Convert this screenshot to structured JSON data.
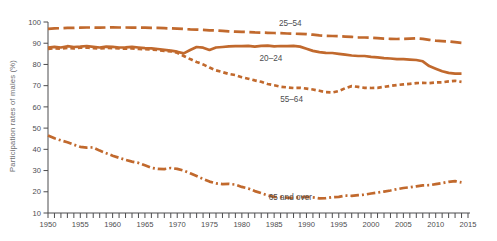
{
  "figure": {
    "background": "#ffffff"
  },
  "chart_data": {
    "type": "line",
    "title": "",
    "xlabel": "",
    "ylabel": "Participation rates of males (%)",
    "ylim": [
      10,
      100
    ],
    "xlim": [
      1950,
      2015
    ],
    "yticks": [
      100,
      90,
      80,
      70,
      60,
      50,
      40,
      30,
      20,
      10
    ],
    "xtick_labels": [
      1950,
      1955,
      1960,
      1965,
      1970,
      1975,
      1980,
      1985,
      1990,
      1995,
      2000,
      2005,
      2010,
      2015
    ],
    "xtick_minor_step": 1,
    "grid": false,
    "legend_position": "inline-labels",
    "line_color": "#c1692d",
    "axis_color": "#4d4d4f",
    "text_color": "#4d4d4f",
    "ylabel_color": "#6d6e71",
    "years": [
      1950,
      1951,
      1952,
      1953,
      1954,
      1955,
      1956,
      1957,
      1958,
      1959,
      1960,
      1961,
      1962,
      1963,
      1964,
      1965,
      1966,
      1967,
      1968,
      1969,
      1970,
      1971,
      1972,
      1973,
      1974,
      1975,
      1976,
      1977,
      1978,
      1979,
      1980,
      1981,
      1982,
      1983,
      1984,
      1985,
      1986,
      1987,
      1988,
      1989,
      1990,
      1991,
      1992,
      1993,
      1994,
      1995,
      1996,
      1997,
      1998,
      1999,
      2000,
      2001,
      2002,
      2003,
      2004,
      2005,
      2006,
      2007,
      2008,
      2009,
      2010,
      2011,
      2012,
      2013,
      2014
    ],
    "series": [
      {
        "name": "25-54",
        "label": "25–54",
        "dash": "long-dash",
        "label_pos": {
          "year": 1987.5,
          "value": 98.2
        },
        "values": [
          96.8,
          97,
          97.1,
          97.2,
          97.2,
          97.3,
          97.4,
          97.4,
          97.3,
          97.4,
          97.5,
          97.4,
          97.4,
          97.3,
          97.3,
          97.3,
          97.2,
          97.2,
          97.1,
          97,
          96.9,
          96.7,
          96.5,
          96.4,
          96.3,
          96.1,
          96,
          95.8,
          95.6,
          95.5,
          95.4,
          95.3,
          95.1,
          95,
          94.9,
          94.8,
          94.7,
          94.6,
          94.5,
          94.4,
          94.3,
          94,
          93.7,
          93.5,
          93.4,
          93.3,
          93.1,
          93,
          92.8,
          92.7,
          92.6,
          92.4,
          92.2,
          92.1,
          92,
          92.1,
          92.2,
          92.3,
          92.1,
          91.6,
          91.2,
          91,
          90.8,
          90.5,
          90.2
        ]
      },
      {
        "name": "20-24",
        "label": "20–24",
        "dash": "solid",
        "label_pos": {
          "year": 1984.5,
          "value": 81.4
        },
        "values": [
          88,
          88.3,
          88,
          88.6,
          88.2,
          88.4,
          88.7,
          88.3,
          88,
          88.4,
          88.3,
          88,
          88.1,
          88.3,
          88,
          87.7,
          87.6,
          87.3,
          86.9,
          86.5,
          86,
          85.2,
          86.8,
          88.2,
          87.9,
          86.8,
          88,
          88.2,
          88.5,
          88.6,
          88.6,
          88.8,
          88.4,
          88.8,
          88.9,
          88.5,
          88.7,
          88.6,
          88.8,
          88.4,
          87.4,
          86.4,
          85.8,
          85.5,
          85.4,
          85,
          84.6,
          84.2,
          84,
          84,
          83.6,
          83.3,
          83,
          82.8,
          82.5,
          82.5,
          82.3,
          82.1,
          81.5,
          79.2,
          78,
          76.8,
          76,
          75.7,
          75.7
        ]
      },
      {
        "name": "55-64",
        "label": "55–64",
        "dash": "short-dash",
        "label_pos": {
          "year": 1987.7,
          "value": 62.4
        },
        "values": [
          87.3,
          87.6,
          87.4,
          87.8,
          87.5,
          87.9,
          88,
          87.7,
          87.5,
          87.8,
          87.7,
          87.5,
          87.4,
          87.6,
          87.3,
          87.2,
          87,
          86.8,
          86.4,
          86.2,
          85.5,
          84,
          82.5,
          81.2,
          80,
          78.5,
          77.2,
          76.4,
          75.5,
          75,
          74,
          73.3,
          72.5,
          71.8,
          70.8,
          70.2,
          69.5,
          69.2,
          68.9,
          69,
          68.6,
          68.2,
          67.6,
          66.9,
          66.8,
          67.5,
          68.8,
          69.8,
          69.4,
          69,
          68.9,
          69,
          69.4,
          69.9,
          70.3,
          70.6,
          70.9,
          71.2,
          71.3,
          71.2,
          71.5,
          71.6,
          72,
          72.3,
          71.8
        ]
      },
      {
        "name": "65-and-over",
        "label": "65 and over",
        "dash": "dash-dot",
        "label_pos": {
          "year": 1987.5,
          "value": 16.2
        },
        "values": [
          46.5,
          45.2,
          44.2,
          43.3,
          42.2,
          41.2,
          40.8,
          40.9,
          39.4,
          38.2,
          37,
          36,
          35,
          34.2,
          33.6,
          32.5,
          31.3,
          30.8,
          30.7,
          31.2,
          30.8,
          30,
          28.7,
          27.4,
          26,
          24.8,
          24,
          23.6,
          23.7,
          23.4,
          22.3,
          21.6,
          20.3,
          19.4,
          18.3,
          17.6,
          17.5,
          17.2,
          17.1,
          17.5,
          17.6,
          17.4,
          16.9,
          17,
          17.4,
          17.6,
          18.2,
          18.1,
          18.4,
          18.6,
          19.2,
          19.6,
          20.1,
          20.6,
          21.2,
          21.8,
          22.1,
          22.6,
          23,
          23.1,
          23.6,
          24.1,
          24.7,
          25,
          24.4
        ]
      }
    ]
  }
}
